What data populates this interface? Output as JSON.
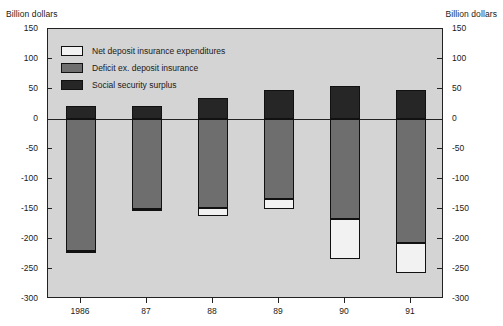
{
  "chart_data": {
    "type": "bar",
    "title": "",
    "subtitle": "",
    "ylabel": "Billion dollars",
    "ylabel_right": "Billion dollars",
    "xlabel": "",
    "ylim": [
      -300,
      150
    ],
    "ytick_step": 50,
    "grid": false,
    "stacked": true,
    "legend_position": "inside-top-left",
    "categories": [
      "1986",
      "87",
      "88",
      "89",
      "90",
      "91"
    ],
    "ytick_labels": [
      "150",
      "100",
      "50",
      "0",
      "-50",
      "-100",
      "-150",
      "-200",
      "-250",
      "-300"
    ],
    "ytick_values": [
      150,
      100,
      50,
      0,
      -50,
      -100,
      -150,
      -200,
      -250,
      -300
    ],
    "series": [
      {
        "name": "Social security surplus",
        "color": "#262626",
        "values": [
          22,
          22,
          35,
          48,
          55,
          48
        ]
      },
      {
        "name": "Deficit ex. deposit insurance",
        "color": "#6e6e6e",
        "values": [
          -220,
          -150,
          -148,
          -133,
          -167,
          -207
        ]
      },
      {
        "name": "Net deposit insurance expenditures",
        "color": "#f2f2f2",
        "values": [
          -3,
          -3,
          -14,
          -17,
          -66,
          -50
        ]
      }
    ],
    "bar_totals": [
      -223,
      -153,
      -162,
      -150,
      -233,
      -257
    ],
    "annotations": []
  },
  "legend": {
    "items": [
      {
        "label": "Net deposit insurance expenditures",
        "key": "ndi"
      },
      {
        "label": "Deficit ex. deposit insurance",
        "key": "deficit"
      },
      {
        "label": "Social security surplus",
        "key": "social"
      }
    ]
  },
  "colors": {
    "plot_background": "#d4d4d4",
    "page_background": "#ffffff",
    "axis": "#222222",
    "social": "#262626",
    "deficit": "#6e6e6e",
    "ndi": "#f2f2f2"
  }
}
